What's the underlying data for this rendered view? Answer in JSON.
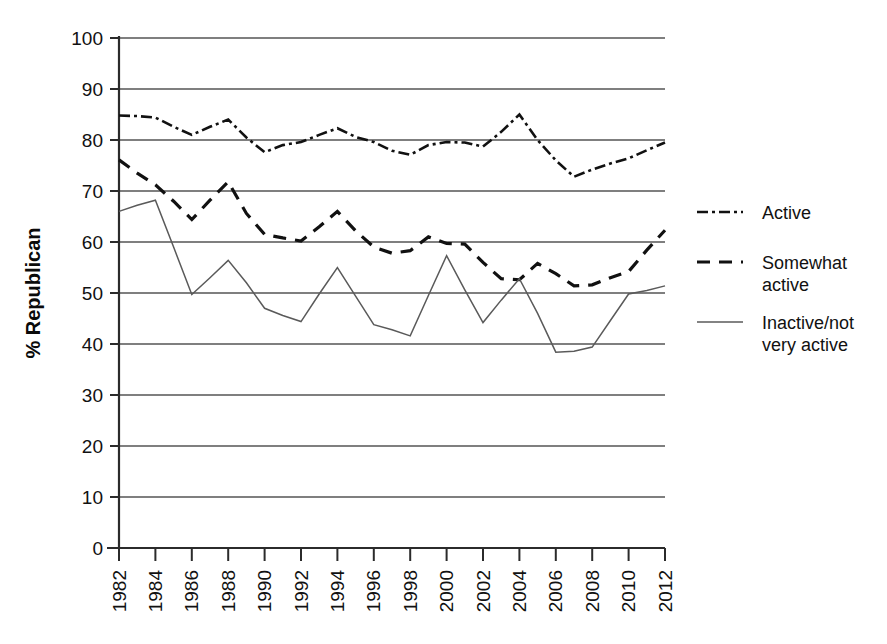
{
  "chart_data": {
    "type": "line",
    "title": "",
    "subtitle": "",
    "xlabel": "",
    "ylabel": "% Republican",
    "ylim": [
      0,
      100
    ],
    "yticks": [
      0,
      10,
      20,
      30,
      40,
      50,
      60,
      70,
      80,
      90,
      100
    ],
    "xlim": [
      1982,
      2012
    ],
    "grid": "horizontal",
    "legend_position": "right",
    "x": [
      1982,
      1983,
      1984,
      1985,
      1986,
      1987,
      1988,
      1989,
      1990,
      1991,
      1992,
      1993,
      1994,
      1995,
      1996,
      1997,
      1998,
      1999,
      2000,
      2001,
      2002,
      2003,
      2004,
      2005,
      2006,
      2007,
      2008,
      2009,
      2010,
      2011,
      2012
    ],
    "xticks": [
      1982,
      1984,
      1986,
      1988,
      1990,
      1992,
      1994,
      1996,
      1998,
      2000,
      2002,
      2004,
      2006,
      2008,
      2010,
      2012
    ],
    "xtick_labels": [
      "1982",
      "1984",
      "1986",
      "1988",
      "1990",
      "1992",
      "1994",
      "1996",
      "1998",
      "2000",
      "2002",
      "2004",
      "2006",
      "2008",
      "2010",
      "2012"
    ],
    "series": [
      {
        "name": "Active",
        "style": "dash-dot",
        "color": "#111111",
        "width": 2.6,
        "dasharray": "11,4,3,4",
        "values": [
          84.8,
          84.7,
          84.4,
          82.6,
          81.0,
          82.6,
          84.0,
          80.5,
          77.6,
          79.0,
          79.6,
          81.0,
          82.3,
          80.6,
          79.6,
          77.9,
          77.1,
          79.0,
          79.6,
          79.5,
          78.7,
          81.6,
          85.0,
          80.0,
          76.0,
          72.8,
          74.2,
          75.4,
          76.4,
          78.0,
          79.5
        ]
      },
      {
        "name": "Somewhat active",
        "style": "dashed",
        "color": "#111111",
        "width": 3.2,
        "dasharray": "13,9",
        "values": [
          76.1,
          73.5,
          71.2,
          68.0,
          64.4,
          68.2,
          71.8,
          65.6,
          61.5,
          60.8,
          60.2,
          63.0,
          66.0,
          62.2,
          59.0,
          57.8,
          58.3,
          61.0,
          59.7,
          59.6,
          56.0,
          52.8,
          52.6,
          55.8,
          53.8,
          51.4,
          51.6,
          53.0,
          54.2,
          58.4,
          62.3
        ]
      },
      {
        "name": "Inactive/not very active",
        "style": "solid",
        "color": "#5a5a5a",
        "width": 1.5,
        "dasharray": "none",
        "values": [
          66.0,
          67.2,
          68.2,
          59.0,
          49.7,
          53.0,
          56.4,
          52.0,
          47.0,
          45.6,
          44.4,
          49.8,
          55.0,
          49.4,
          43.8,
          42.8,
          41.6,
          49.5,
          57.3,
          50.6,
          44.2,
          48.6,
          52.8,
          46.0,
          38.4,
          38.6,
          39.4,
          44.6,
          49.8,
          50.5,
          51.4
        ]
      }
    ],
    "legend": [
      {
        "label_line1": "Active",
        "label_line2": ""
      },
      {
        "label_line1": "Somewhat",
        "label_line2": "active"
      },
      {
        "label_line1": "Inactive/not",
        "label_line2": "very active"
      }
    ]
  }
}
